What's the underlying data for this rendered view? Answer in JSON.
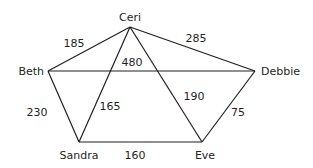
{
  "diagram": {
    "type": "weighted-undirected-graph",
    "colors": {
      "line": "#231f20",
      "text": "#231f20",
      "background": "#ffffff"
    },
    "nodes": [
      {
        "id": "ceri",
        "label": "Ceri",
        "x": 130,
        "y": 27,
        "lx": 130,
        "ly": 21,
        "anchor": "middle"
      },
      {
        "id": "beth",
        "label": "Beth",
        "x": 48,
        "y": 71,
        "lx": 44,
        "ly": 75,
        "anchor": "end"
      },
      {
        "id": "debbie",
        "label": "Debbie",
        "x": 255,
        "y": 71,
        "lx": 261,
        "ly": 75,
        "anchor": "start"
      },
      {
        "id": "sandra",
        "label": "Sandra",
        "x": 79,
        "y": 142,
        "lx": 79,
        "ly": 159,
        "anchor": "middle"
      },
      {
        "id": "eve",
        "label": "Eve",
        "x": 202,
        "y": 142,
        "lx": 205,
        "ly": 159,
        "anchor": "middle"
      }
    ],
    "edges": [
      {
        "from": "ceri",
        "to": "beth",
        "weight": "185",
        "lx": 74,
        "ly": 47
      },
      {
        "from": "ceri",
        "to": "debbie",
        "weight": "285",
        "lx": 196,
        "ly": 42
      },
      {
        "from": "beth",
        "to": "debbie",
        "weight": "480",
        "lx": 132,
        "ly": 66
      },
      {
        "from": "ceri",
        "to": "sandra",
        "weight": "165",
        "lx": 110,
        "ly": 110
      },
      {
        "from": "ceri",
        "to": "eve",
        "weight": "190",
        "lx": 194,
        "ly": 100
      },
      {
        "from": "beth",
        "to": "sandra",
        "weight": "230",
        "lx": 37,
        "ly": 116
      },
      {
        "from": "debbie",
        "to": "eve",
        "weight": "75",
        "lx": 238,
        "ly": 116
      },
      {
        "from": "sandra",
        "to": "eve",
        "weight": "160",
        "lx": 135,
        "ly": 159
      }
    ]
  }
}
